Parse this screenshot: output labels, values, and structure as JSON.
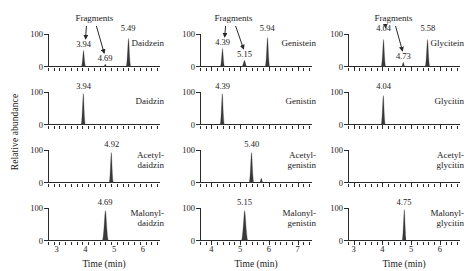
{
  "figure": {
    "y_axis_label": "Relative abundance",
    "x_axis_label": "Time (min)",
    "y_ticks": [
      "100",
      "0"
    ],
    "fragments_label": "Fragments"
  },
  "chart_data": {
    "type": "line",
    "title": "",
    "xlabel": "Time (min)",
    "ylabel": "Relative abundance",
    "ylim": [
      0,
      100
    ],
    "grid": false,
    "legend": "none",
    "panels": [
      {
        "row": 1,
        "col": 1,
        "compound": "Daidzein",
        "annotation": "Fragments",
        "xlim": [
          2.7,
          6.6
        ],
        "xticks": [
          3,
          4,
          5,
          6
        ],
        "peaks": [
          {
            "x": 3.94,
            "height": 52,
            "label": "3.94",
            "width": 0.055
          },
          {
            "x": 4.69,
            "height": 9,
            "label": "4.69",
            "width": 0.05
          },
          {
            "x": 5.49,
            "height": 88,
            "label": "5.49",
            "width": 0.055
          }
        ]
      },
      {
        "row": 2,
        "col": 1,
        "compound": "Daidzin",
        "annotation": "",
        "xlim": [
          2.7,
          6.6
        ],
        "xticks": [
          3,
          4,
          5,
          6
        ],
        "peaks": [
          {
            "x": 3.94,
            "height": 96,
            "label": "3.94",
            "width": 0.05
          }
        ]
      },
      {
        "row": 3,
        "col": 1,
        "compound": "Acetyl-\ndaidzin",
        "annotation": "",
        "xlim": [
          2.7,
          6.6
        ],
        "xticks": [
          3,
          4,
          5,
          6
        ],
        "peaks": [
          {
            "x": 4.92,
            "height": 94,
            "label": "4.92",
            "width": 0.05
          }
        ]
      },
      {
        "row": 4,
        "col": 1,
        "compound": "Malonyl-\ndaidzin",
        "annotation": "",
        "xlim": [
          2.7,
          6.6
        ],
        "xticks": [
          3,
          4,
          5,
          6
        ],
        "peaks": [
          {
            "x": 4.69,
            "height": 95,
            "label": "4.69",
            "width": 0.075
          }
        ]
      },
      {
        "row": 1,
        "col": 2,
        "compound": "Genistein",
        "annotation": "Fragments",
        "xlim": [
          3.6,
          7.5
        ],
        "xticks": [
          4,
          5,
          6,
          7
        ],
        "peaks": [
          {
            "x": 4.39,
            "height": 58,
            "label": "4.39",
            "width": 0.055
          },
          {
            "x": 5.15,
            "height": 22,
            "label": "5.15",
            "width": 0.075
          },
          {
            "x": 5.94,
            "height": 92,
            "label": "5.94",
            "width": 0.055
          }
        ]
      },
      {
        "row": 2,
        "col": 2,
        "compound": "Genistin",
        "annotation": "",
        "xlim": [
          3.6,
          7.5
        ],
        "xticks": [
          4,
          5,
          6,
          7
        ],
        "peaks": [
          {
            "x": 4.39,
            "height": 96,
            "label": "4.39",
            "width": 0.05
          }
        ]
      },
      {
        "row": 3,
        "col": 2,
        "compound": "Acetyl-\ngenistin",
        "annotation": "",
        "xlim": [
          3.6,
          7.5
        ],
        "xticks": [
          4,
          5,
          6,
          7
        ],
        "peaks": [
          {
            "x": 5.4,
            "height": 94,
            "label": "5.40",
            "width": 0.055
          },
          {
            "x": 5.72,
            "height": 16,
            "label": "",
            "width": 0.05
          }
        ]
      },
      {
        "row": 4,
        "col": 2,
        "compound": "Malonyl-\ngenistin",
        "annotation": "",
        "xlim": [
          3.6,
          7.5
        ],
        "xticks": [
          4,
          5,
          6,
          7
        ],
        "peaks": [
          {
            "x": 5.15,
            "height": 95,
            "label": "5.15",
            "width": 0.08
          }
        ]
      },
      {
        "row": 1,
        "col": 3,
        "compound": "Glycitein",
        "annotation": "Fragments",
        "xlim": [
          2.8,
          6.7
        ],
        "xticks": [
          3,
          4,
          5,
          6
        ],
        "peaks": [
          {
            "x": 4.04,
            "height": 86,
            "label": "4.04",
            "width": 0.055
          },
          {
            "x": 4.73,
            "height": 16,
            "label": "4.73",
            "width": 0.05
          },
          {
            "x": 5.58,
            "height": 84,
            "label": "5.58",
            "width": 0.055
          }
        ]
      },
      {
        "row": 2,
        "col": 3,
        "compound": "Glycitin",
        "annotation": "",
        "xlim": [
          2.8,
          6.7
        ],
        "xticks": [
          3,
          4,
          5,
          6
        ],
        "peaks": [
          {
            "x": 4.04,
            "height": 92,
            "label": "4.04",
            "width": 0.05
          }
        ]
      },
      {
        "row": 3,
        "col": 3,
        "compound": "Acetyl-\nglycitin",
        "annotation": "",
        "xlim": [
          2.8,
          6.7
        ],
        "xticks": [
          3,
          4,
          5,
          6
        ],
        "peaks": []
      },
      {
        "row": 4,
        "col": 3,
        "compound": "Malonyl-\nglycitin",
        "annotation": "",
        "xlim": [
          2.8,
          6.7
        ],
        "xticks": [
          3,
          4,
          5,
          6
        ],
        "peaks": [
          {
            "x": 4.75,
            "height": 96,
            "label": "4.75",
            "width": 0.05
          }
        ]
      }
    ]
  }
}
